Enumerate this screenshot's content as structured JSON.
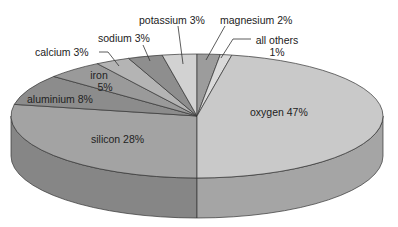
{
  "chart_data": {
    "type": "pie",
    "style": "3d-grayscale",
    "title": "",
    "slices": [
      {
        "label": "oxygen",
        "value": 47,
        "display": "oxygen 47%",
        "color": "#c9c9c9"
      },
      {
        "label": "silicon",
        "value": 28,
        "display": "silicon 28%",
        "color": "#a3a3a3"
      },
      {
        "label": "aluminium",
        "value": 8,
        "display": "aluminium 8%",
        "color": "#8c8c8c"
      },
      {
        "label": "iron",
        "value": 5,
        "display": "iron 5%",
        "color": "#9a9a9a"
      },
      {
        "label": "calcium",
        "value": 3,
        "display": "calcium 3%",
        "color": "#b4b4b4"
      },
      {
        "label": "sodium",
        "value": 3,
        "display": "sodium 3%",
        "color": "#8e8e8e"
      },
      {
        "label": "potassium",
        "value": 3,
        "display": "potassium 3%",
        "color": "#d2d2d2"
      },
      {
        "label": "magnesium",
        "value": 2,
        "display": "magnesium 2%",
        "color": "#9c9c9c"
      },
      {
        "label": "all others",
        "value": 1,
        "display": "all others 1%",
        "color": "#dadada"
      }
    ],
    "legend": "none (direct labels)"
  },
  "labels": {
    "oxygen": "oxygen 47%",
    "silicon": "silicon 28%",
    "aluminium": "aluminium 8%",
    "iron_1": "iron",
    "iron_2": "5%",
    "calcium": "calcium 3%",
    "sodium": "sodium 3%",
    "potassium": "potassium 3%",
    "magnesium": "magnesium 2%",
    "others_1": "all others",
    "others_2": "1%"
  }
}
